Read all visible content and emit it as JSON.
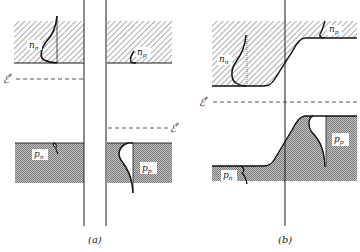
{
  "figure": {
    "panels": [
      {
        "id": "a",
        "caption": "(a)",
        "labels": {
          "n_n": "n",
          "n_n_sub": "n",
          "n_p": "n",
          "n_p_sub": "p",
          "p_n": "p",
          "p_n_sub": "n",
          "p_p": "p",
          "p_p_sub": "p",
          "fermi_left": "ℰ",
          "fermi_left_sup": "*",
          "fermi_right": "ℰ",
          "fermi_right_sup": "*"
        }
      },
      {
        "id": "b",
        "caption": "(b)",
        "labels": {
          "n_n": "n",
          "n_n_sub": "n",
          "n_p": "n",
          "n_p_sub": "p",
          "p_n": "p",
          "p_n_sub": "n",
          "p_p": "p",
          "p_p_sub": "p",
          "fermi": "ℰ",
          "fermi_sup": "*"
        }
      }
    ],
    "colors": {
      "line": "#1a1a1a",
      "hatch": "#555555",
      "valence_fill": "#9a9a9a",
      "background": "#ffffff"
    }
  }
}
